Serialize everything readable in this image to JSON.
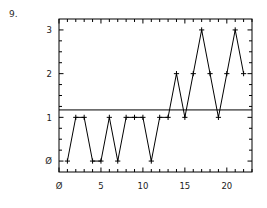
{
  "figure": {
    "number_label": "9."
  },
  "chart_data": {
    "type": "line",
    "title": "",
    "subtitle": "",
    "xlabel": "",
    "ylabel": "",
    "x": [
      1,
      2,
      3,
      4,
      5,
      6,
      7,
      8,
      9,
      10,
      11,
      12,
      13,
      14,
      15,
      16,
      17,
      18,
      19,
      20,
      21,
      22
    ],
    "values": [
      0,
      1,
      1,
      0,
      0,
      1,
      0,
      1,
      1,
      1,
      0,
      1,
      1,
      2,
      1,
      2,
      3,
      2,
      1,
      2,
      3,
      2
    ],
    "series": [
      {
        "name": "observations",
        "values": [
          0,
          1,
          1,
          0,
          0,
          1,
          0,
          1,
          1,
          1,
          0,
          1,
          1,
          2,
          1,
          2,
          3,
          2,
          1,
          2,
          3,
          2
        ],
        "marker": "plus",
        "color": "#000000"
      }
    ],
    "reference_line": {
      "orientation": "horizontal",
      "value": 1.17,
      "color": "#000000",
      "label": ""
    },
    "xlim": [
      0,
      23
    ],
    "ylim": [
      -0.25,
      3.25
    ],
    "xticks": [
      0,
      5,
      10,
      15,
      20
    ],
    "xtick_labels": [
      "Ø",
      "5",
      "10",
      "15",
      "20"
    ],
    "xticks_minor": [
      1,
      2,
      3,
      4,
      6,
      7,
      8,
      9,
      11,
      12,
      13,
      14,
      16,
      17,
      18,
      19,
      21,
      22,
      23
    ],
    "yticks": [
      0,
      1,
      2,
      3
    ],
    "ytick_labels": [
      "Ø",
      "1",
      "2",
      "3"
    ],
    "yticks_minor": [
      0.25,
      0.5,
      0.75,
      1.25,
      1.5,
      1.75,
      2.25,
      2.5,
      2.75
    ],
    "grid": false,
    "legend": null,
    "frame": true
  }
}
